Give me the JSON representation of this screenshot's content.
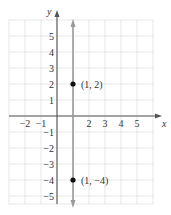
{
  "chart_data": {
    "type": "line",
    "title": "",
    "xlabel": "x",
    "ylabel": "y",
    "xlim": [
      -3,
      6
    ],
    "ylim": [
      -5.5,
      6
    ],
    "grid": true,
    "x_ticks": [
      -2,
      -1,
      2,
      3,
      4,
      5
    ],
    "x_tick_labels": [
      "−2",
      "−1",
      "2",
      "3",
      "4",
      "5"
    ],
    "y_ticks": [
      5,
      4,
      3,
      2,
      1,
      -1,
      -2,
      -3,
      -4,
      -5
    ],
    "y_tick_labels": [
      "5",
      "4",
      "3",
      "2",
      "1",
      "−1",
      "−2",
      "−3",
      "−4",
      "−5"
    ],
    "series": [
      {
        "name": "x = 1",
        "kind": "vertical-line",
        "x": 1,
        "color": "#9a9a9a",
        "arrows": "both"
      }
    ],
    "points": [
      {
        "x": 1,
        "y": 2,
        "label": "(1, 2)"
      },
      {
        "x": 1,
        "y": -4,
        "label": "(1, −4)"
      }
    ],
    "colors": {
      "grid": "#d6d6d6",
      "axis": "#555555",
      "line": "#9a9a9a",
      "point": "#111111",
      "text": "#333333"
    }
  }
}
